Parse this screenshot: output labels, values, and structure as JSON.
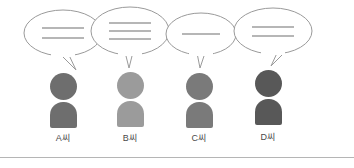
{
  "illustration": {
    "title": "four-people-speech-bubbles",
    "background_color": "#ffffff",
    "divider_color": "#b5b5b5",
    "divider_y": 157,
    "bubble_stroke_color": "#9a9a9a",
    "bubble_fill_color": "#ffffff",
    "bubble_line_color": "#6e6e6e",
    "label_color": "#4a4a4a"
  },
  "people": [
    {
      "id": "person-a",
      "label": "A씨",
      "x": 19,
      "figure_color": "#6e6e6e",
      "bubble": {
        "line_count": 2,
        "lines": [
          "",
          ""
        ],
        "tail_direction": "down-right",
        "cx": 44,
        "cy": 33,
        "rx": 39,
        "ry": 23,
        "line_y": [
          28,
          38
        ],
        "line_x1": 23,
        "line_x2": 65,
        "tail": "49,53 57,70 42,55"
      },
      "person_top": 73,
      "label_y": 131
    },
    {
      "id": "person-b",
      "label": "B씨",
      "x": 86,
      "figure_color": "#9b9b9b",
      "bubble": {
        "line_count": 3,
        "lines": [
          "",
          "",
          ""
        ],
        "tail_direction": "down",
        "cx": 44,
        "cy": 31,
        "rx": 39,
        "ry": 24,
        "line_y": [
          23,
          31,
          39
        ],
        "line_x1": 23,
        "line_x2": 65,
        "tail": "39,52 47,52 43,68"
      },
      "person_top": 72,
      "label_y": 131
    },
    {
      "id": "person-c",
      "label": "C씨",
      "x": 155,
      "figure_color": "#7a7a7a",
      "bubble": {
        "line_count": 1,
        "lines": [
          ""
        ],
        "tail_direction": "down",
        "cx": 46,
        "cy": 34,
        "rx": 35,
        "ry": 21,
        "line_y": [
          34
        ],
        "line_x1": 27,
        "line_x2": 65,
        "tail": "42,53 50,53 45,68"
      },
      "person_top": 73,
      "label_y": 131
    },
    {
      "id": "person-d",
      "label": "D씨",
      "x": 224,
      "figure_color": "#585858",
      "bubble": {
        "line_count": 2,
        "lines": [
          "",
          ""
        ],
        "tail_direction": "down-left",
        "cx": 49,
        "cy": 31,
        "rx": 39,
        "ry": 23,
        "line_y": [
          27,
          36
        ],
        "line_x1": 28,
        "line_x2": 70,
        "tail": "54,51 62,51 47,66"
      },
      "person_top": 70,
      "label_y": 130
    }
  ]
}
